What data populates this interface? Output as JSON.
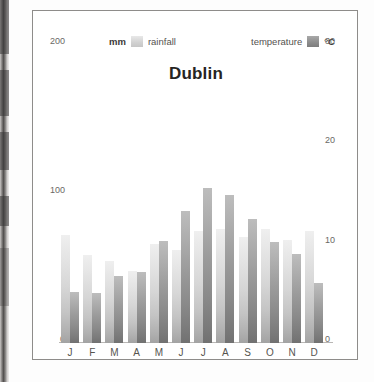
{
  "figure": {
    "title": "Dublin"
  },
  "legend": {
    "rainfall": {
      "unit": "mm",
      "label": "rainfall",
      "swatch_color": "#d3d3d3"
    },
    "temperature": {
      "label": "temperature",
      "unit": "°C",
      "swatch_color": "#8e8e8e"
    }
  },
  "axes": {
    "left_ticks": [
      "200",
      "100",
      "0"
    ],
    "right_ticks": [
      "30",
      "20",
      "10",
      "0"
    ]
  },
  "chart_data": {
    "type": "bar",
    "title": "Dublin",
    "subtitle": "",
    "xlabel": "",
    "ylabel": "mm",
    "y2label": "°C",
    "ylim": [
      0,
      200
    ],
    "y2lim": [
      0,
      30
    ],
    "grid": false,
    "legend_position": "top",
    "categories": [
      "J",
      "F",
      "M",
      "A",
      "M",
      "J",
      "J",
      "A",
      "S",
      "O",
      "N",
      "D"
    ],
    "series": [
      {
        "name": "rainfall",
        "unit": "mm",
        "axis": "left",
        "color": "#d3d3d3",
        "values": [
          67,
          55,
          51,
          45,
          62,
          58,
          70,
          71,
          66,
          71,
          64,
          70
        ]
      },
      {
        "name": "temperature",
        "unit": "°C",
        "axis": "right",
        "color": "#8e8e8e",
        "values": [
          4.8,
          4.7,
          6.3,
          6.6,
          9.5,
          12.3,
          14.5,
          13.8,
          11.6,
          9.4,
          8.3,
          5.6
        ]
      }
    ]
  }
}
